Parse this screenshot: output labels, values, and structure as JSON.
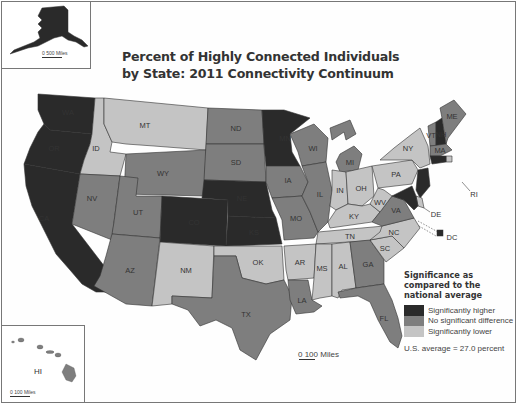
{
  "title_line1": "Percent of Highly Connected Individuals",
  "title_line2": "by State: 2011 Connectivity Continuum",
  "colors": {
    "higher": "#2a2a2a",
    "no_difference": "#7e7e7e",
    "lower": "#c4c4c4",
    "border": "#333333",
    "water": "#ffffff"
  },
  "legend": {
    "title": "Significance as compared to the national average",
    "items": [
      {
        "key": "higher",
        "label": "Significantly higher"
      },
      {
        "key": "no_difference",
        "label": "No significant difference"
      },
      {
        "key": "lower",
        "label": "Significantly lower"
      }
    ],
    "average_note": "U.S. average = 27.0 percent"
  },
  "scales": {
    "main": "0   100 Miles",
    "alaska": "0    500 Miles",
    "hawaii": "0     100 Miles"
  },
  "map_data": {
    "type": "choropleth",
    "variable": "Percent of highly connected individuals",
    "year": 2011,
    "states": {
      "WA": "higher",
      "OR": "higher",
      "CA": "higher",
      "ID": "lower",
      "NV": "no_difference",
      "MT": "lower",
      "WY": "no_difference",
      "UT": "no_difference",
      "AZ": "no_difference",
      "CO": "higher",
      "NM": "lower",
      "ND": "no_difference",
      "SD": "no_difference",
      "NE": "higher",
      "KS": "higher",
      "OK": "lower",
      "TX": "no_difference",
      "MN": "higher",
      "IA": "no_difference",
      "MO": "no_difference",
      "AR": "lower",
      "LA": "no_difference",
      "WI": "no_difference",
      "IL": "no_difference",
      "MI": "no_difference",
      "IN": "lower",
      "OH": "lower",
      "KY": "lower",
      "TN": "lower",
      "MS": "lower",
      "AL": "lower",
      "GA": "no_difference",
      "FL": "no_difference",
      "SC": "lower",
      "NC": "lower",
      "VA": "no_difference",
      "WV": "lower",
      "PA": "lower",
      "NY": "lower",
      "VT": "no_difference",
      "NH": "higher",
      "ME": "no_difference",
      "MA": "no_difference",
      "RI": "lower",
      "CT": "higher",
      "NJ": "higher",
      "DE": "lower",
      "MD": "higher",
      "DC": "higher",
      "AK": "higher",
      "HI": "no_difference"
    }
  }
}
